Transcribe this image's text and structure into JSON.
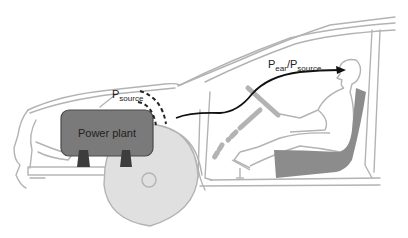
{
  "diagram": {
    "labels": {
      "power_plant": "Power plant",
      "p_source_main": "P",
      "p_source_sub": "source",
      "ratio_p1_main": "P",
      "ratio_p1_sub": "ear",
      "ratio_slash": "/",
      "ratio_p2_main": "P",
      "ratio_p2_sub": "source"
    },
    "components": [
      "car-body-outline",
      "power-plant",
      "engine-mounts",
      "front-wheel",
      "sound-wave-dashes",
      "transfer-path-arrow",
      "steering-column",
      "driver",
      "seat",
      "pedal",
      "floor"
    ],
    "colors": {
      "outline": "#b3b3b3",
      "power_plant_fill": "#7a7a7a",
      "power_plant_stroke": "#4a4a4a",
      "mount_fill": "#3d3d3d",
      "wheel_fill": "#e0e0e0",
      "seat_fill": "#8c8c8c",
      "arrow": "#111111",
      "text": "#222222"
    }
  }
}
